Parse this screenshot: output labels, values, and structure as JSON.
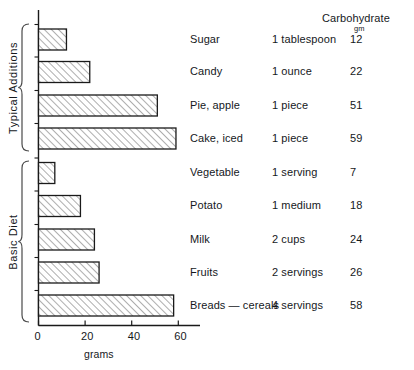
{
  "chart_data": {
    "type": "bar",
    "title": "",
    "subtitle": "",
    "orientation": "horizontal",
    "xlabel": "grams",
    "ylabel": "",
    "xlim": [
      0,
      70
    ],
    "xticks": [
      0,
      20,
      40,
      60
    ],
    "xtick_labels": [
      "0",
      "20",
      "40",
      "60"
    ],
    "grid": false,
    "legend": false,
    "value_column_header": "Carbohydrate",
    "value_column_unit": "gm",
    "categories": [
      "Sugar",
      "Candy",
      "Pie, apple",
      "Cake, iced",
      "Vegetable",
      "Potato",
      "Milk",
      "Fruits",
      "Breads — cereals"
    ],
    "values": [
      12,
      22,
      51,
      59,
      7,
      18,
      24,
      26,
      58
    ],
    "servings": [
      "1 tablespoon",
      "1 ounce",
      "1 piece",
      "1 piece",
      "1 serving",
      "1 medium",
      "2 cups",
      "2 servings",
      "4 servings"
    ],
    "groups": [
      {
        "label": "Typical Additions",
        "indices": [
          0,
          1,
          2,
          3
        ]
      },
      {
        "label": "Basic Diet",
        "indices": [
          4,
          5,
          6,
          7,
          8
        ]
      }
    ],
    "bar_fill": "#ffffff",
    "bar_hatch": "diagonal",
    "bar_edge_color": "#1a1a1a",
    "axis_color": "#1a1a1a"
  },
  "rows": [
    {
      "name": "Sugar",
      "serving": "1 tablespoon",
      "grams": "12"
    },
    {
      "name": "Candy",
      "serving": "1 ounce",
      "grams": "22"
    },
    {
      "name": "Pie, apple",
      "serving": "1 piece",
      "grams": "51"
    },
    {
      "name": "Cake, iced",
      "serving": "1 piece",
      "grams": "59"
    },
    {
      "name": "Vegetable",
      "serving": "1 serving",
      "grams": "7"
    },
    {
      "name": "Potato",
      "serving": "1 medium",
      "grams": "18"
    },
    {
      "name": "Milk",
      "serving": "2 cups",
      "grams": "24"
    },
    {
      "name": "Fruits",
      "serving": "2 servings",
      "grams": "26"
    },
    {
      "name": "Breads — cereals",
      "serving": "4 servings",
      "grams": "58"
    }
  ],
  "header": {
    "carbohydrate": "Carbohydrate",
    "gm": "gm"
  },
  "axis": {
    "title": "grams",
    "ticks": [
      "0",
      "20",
      "40",
      "60"
    ]
  },
  "groups": {
    "typical_additions": "Typical Additions",
    "basic_diet": "Basic Diet"
  }
}
